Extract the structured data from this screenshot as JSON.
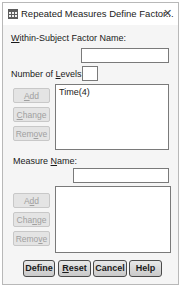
{
  "window": {
    "title": "Repeated Measures Define Factor...",
    "icon": "spreadsheet-grid-icon",
    "close_glyph": "✕"
  },
  "factor": {
    "name_label_pre": "",
    "name_label_accel": "W",
    "name_label_post": "ithin-Subject Factor Name:",
    "name_value": "",
    "levels_label_pre": "Number of ",
    "levels_label_accel": "L",
    "levels_label_post": "evels:",
    "levels_value": "",
    "buttons": {
      "add_pre": "",
      "add_accel": "A",
      "add_post": "dd",
      "change_pre": "",
      "change_accel": "C",
      "change_post": "hange",
      "remove_pre": "Rem",
      "remove_accel": "o",
      "remove_post": "ve"
    },
    "list": [
      "Time(4)"
    ]
  },
  "measure": {
    "name_label_pre": "Measure ",
    "name_label_accel": "N",
    "name_label_post": "ame:",
    "name_value": "",
    "buttons": {
      "add_pre": "A",
      "add_accel": "d",
      "add_post": "d",
      "change_pre": "Cha",
      "change_accel": "n",
      "change_post": "ge",
      "remove_pre": "Remo",
      "remove_accel": "v",
      "remove_post": "e"
    },
    "list": []
  },
  "footer": {
    "define": "Define",
    "reset_pre": "",
    "reset_accel": "R",
    "reset_post": "eset",
    "cancel": "Cancel",
    "help": "Help"
  }
}
